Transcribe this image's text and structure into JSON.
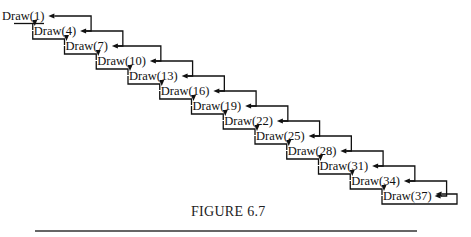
{
  "figure": {
    "caption": "FIGURE 6.7",
    "nodes": [
      {
        "label": "Draw(1)"
      },
      {
        "label": "Draw(4)"
      },
      {
        "label": "Draw(7)"
      },
      {
        "label": "Draw(10)"
      },
      {
        "label": "Draw(13)"
      },
      {
        "label": "Draw(16)"
      },
      {
        "label": "Draw(19)"
      },
      {
        "label": "Draw(22)"
      },
      {
        "label": "Draw(25)"
      },
      {
        "label": "Draw(28)"
      },
      {
        "label": "Draw(31)"
      },
      {
        "label": "Draw(34)"
      },
      {
        "label": "Draw(37)"
      }
    ],
    "edges": {
      "call": "each Draw(n) calls Draw(n+3)",
      "return": "each Draw(n+3) returns to Draw(n)"
    },
    "colors": {
      "ink": "#111111",
      "rule": "#666666",
      "background": "#ffffff"
    }
  }
}
